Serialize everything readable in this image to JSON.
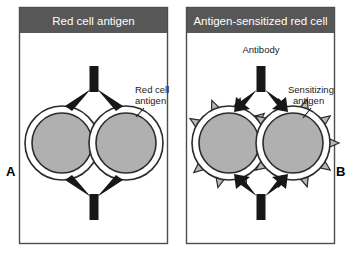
{
  "figure": {
    "title_implicit": "",
    "panels": [
      {
        "id": "A",
        "letter": "A",
        "header": "Red cell antigen",
        "annotations": [
          {
            "name": "red-cell-antigen",
            "lines": [
              "Red cell",
              "antigen"
            ]
          }
        ],
        "cells": 2,
        "antibodies": 2,
        "cell_spikes": 0
      },
      {
        "id": "B",
        "letter": "B",
        "header": "Antigen-sensitized red cell",
        "annotations": [
          {
            "name": "antibody",
            "lines": [
              "Antibody"
            ]
          },
          {
            "name": "sensitizing-antigen",
            "lines": [
              "Sensitizing",
              "antigen"
            ]
          }
        ],
        "cells": 2,
        "antibodies": 2,
        "cell_spikes": 9
      }
    ]
  },
  "colors": {
    "header_fill": "#575757",
    "header_text": "#ffffff",
    "panel_border": "#4d4d4d",
    "panel_bg": "#ffffff",
    "cell_fill": "#b0b0b0",
    "cell_ring": "#ffffff",
    "cell_outline": "#2b2b2b",
    "antibody": "#171717",
    "spike_fill": "#b8b8b8",
    "spike_outline": "#2b2b2b",
    "text": "#1a1a1a",
    "background": "#ffffff"
  },
  "labels": {
    "panel_a_letter": "A",
    "panel_b_letter": "B",
    "panel_a_header": "Red cell antigen",
    "panel_b_header": "Antigen-sensitized red cell",
    "red_cell_antigen_line1": "Red cell",
    "red_cell_antigen_line2": "antigen",
    "antibody": "Antibody",
    "sensitizing_antigen_line1": "Sensitizing",
    "sensitizing_antigen_line2": "antigen"
  }
}
